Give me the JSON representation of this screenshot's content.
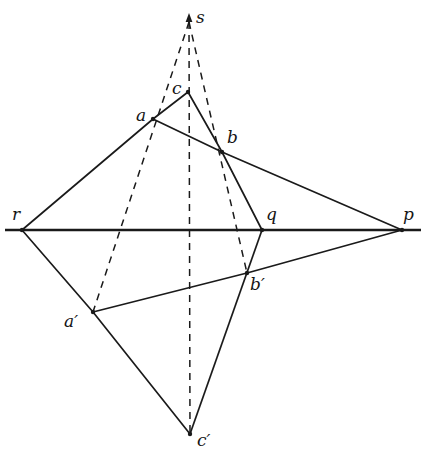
{
  "figure": {
    "background_color": "#ffffff",
    "stroke_color": "#1a1a1a",
    "canvas": {
      "width": 426,
      "height": 461
    }
  },
  "points": {
    "s": {
      "label": "s",
      "x": 189,
      "y": 18,
      "label_x": 196,
      "label_y": 9
    },
    "a": {
      "label": "a",
      "x": 153,
      "y": 119,
      "label_x": 136,
      "label_y": 107
    },
    "b": {
      "label": "b",
      "x": 222,
      "y": 152,
      "label_x": 227,
      "label_y": 129
    },
    "c": {
      "label": "c",
      "x": 188,
      "y": 92,
      "label_x": 172,
      "label_y": 80
    },
    "ap": {
      "label": "a′",
      "x": 93,
      "y": 312,
      "label_x": 64,
      "label_y": 313
    },
    "bp": {
      "label": "b′",
      "x": 247,
      "y": 273,
      "label_x": 250,
      "label_y": 276
    },
    "cp": {
      "label": "c′",
      "x": 190,
      "y": 434,
      "label_x": 197,
      "label_y": 432
    },
    "p": {
      "label": "p",
      "x": 402,
      "y": 230,
      "label_x": 403,
      "label_y": 206
    },
    "q": {
      "label": "q",
      "x": 262,
      "y": 230,
      "label_x": 266,
      "label_y": 206
    },
    "r": {
      "label": "r",
      "x": 22,
      "y": 230,
      "label_x": 12,
      "label_y": 206
    }
  },
  "axis": {
    "name": "axis-of-perspectivity",
    "x1": 5,
    "y1": 230,
    "x2": 421,
    "y2": 230,
    "stroke_width": 2.6
  },
  "solid_edges": [
    {
      "name": "edge-r-a",
      "x1": 22,
      "y1": 230,
      "x2": 153,
      "y2": 119
    },
    {
      "name": "edge-a-c",
      "x1": 153,
      "y1": 119,
      "x2": 188,
      "y2": 92
    },
    {
      "name": "edge-c-b",
      "x1": 188,
      "y1": 92,
      "x2": 222,
      "y2": 152
    },
    {
      "name": "edge-c-q",
      "x1": 222,
      "y1": 152,
      "x2": 262,
      "y2": 230
    },
    {
      "name": "edge-a-b",
      "x1": 153,
      "y1": 119,
      "x2": 222,
      "y2": 152
    },
    {
      "name": "edge-b-p",
      "x1": 222,
      "y1": 152,
      "x2": 402,
      "y2": 230
    },
    {
      "name": "edge-r-ap",
      "x1": 22,
      "y1": 230,
      "x2": 93,
      "y2": 312
    },
    {
      "name": "edge-ap-bp",
      "x1": 93,
      "y1": 312,
      "x2": 247,
      "y2": 273
    },
    {
      "name": "edge-bp-p",
      "x1": 247,
      "y1": 273,
      "x2": 402,
      "y2": 230
    },
    {
      "name": "edge-ap-cp",
      "x1": 93,
      "y1": 312,
      "x2": 190,
      "y2": 434
    },
    {
      "name": "edge-q-cp",
      "x1": 262,
      "y1": 230,
      "x2": 190,
      "y2": 434
    }
  ],
  "dashed_rays": [
    {
      "name": "ray-s-a-ap",
      "x1": 189,
      "y1": 22,
      "x2": 93,
      "y2": 312
    },
    {
      "name": "ray-s-c-cp",
      "x1": 189,
      "y1": 22,
      "x2": 190,
      "y2": 434
    },
    {
      "name": "ray-s-b-bp",
      "x1": 189,
      "y1": 22,
      "x2": 247,
      "y2": 273
    }
  ],
  "arrow": {
    "name": "apex-arrowhead",
    "tip_x": 189,
    "tip_y": 13,
    "half_width": 3.4,
    "height": 9
  },
  "style": {
    "dash_pattern": "7 6",
    "solid_stroke_width": 1.7,
    "dash_stroke_width": 1.5,
    "vertex_dot_radius": 2.2
  }
}
